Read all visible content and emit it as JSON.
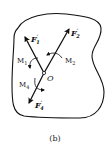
{
  "figure": {
    "caption": "(b)",
    "point": {
      "label": "O"
    },
    "forces": [
      {
        "id": "F1",
        "name": "F",
        "sub": "1",
        "prime": "′"
      },
      {
        "id": "F2",
        "name": "F",
        "sub": "2",
        "prime": "′"
      },
      {
        "id": "F4",
        "name": "F",
        "sub": "4",
        "prime": "′"
      }
    ],
    "moments": [
      {
        "id": "M1",
        "name": "M",
        "sub": "1"
      },
      {
        "id": "M2",
        "name": "M",
        "sub": "2"
      },
      {
        "id": "M4",
        "name": "M",
        "sub": "4"
      }
    ],
    "colors": {
      "stroke": "#111111",
      "background": "#ffffff"
    }
  }
}
